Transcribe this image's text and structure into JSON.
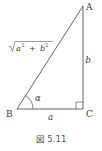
{
  "figure": {
    "caption": "図 5.11",
    "vertices": {
      "A": "A",
      "B": "B",
      "C": "C"
    },
    "sides": {
      "bc": "a",
      "ca": "b",
      "hypotenuse": {
        "radical": "√",
        "a_base": "a",
        "a_exp": "2",
        "plus": "+",
        "b_base": "b",
        "b_exp": "2"
      }
    },
    "angle_b": "α",
    "right_angle_at": "C",
    "line_color": "#555555"
  }
}
